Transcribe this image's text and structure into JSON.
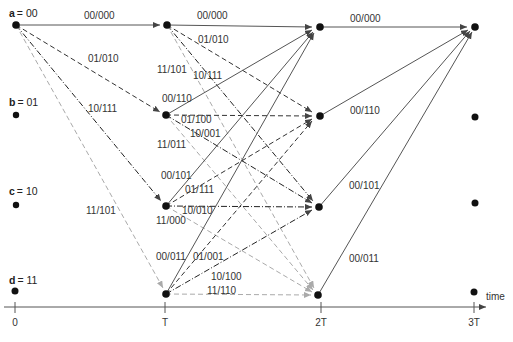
{
  "diagram": {
    "type": "trellis",
    "colors": {
      "solid": "#555555",
      "dashed": "#333333",
      "dashdot": "#222222",
      "lightdashed": "#aaaaaa",
      "node": "#111111",
      "axis": "#555555",
      "text": "#333333"
    },
    "states": [
      {
        "letter": "a",
        "eq": "= 00"
      },
      {
        "letter": "b",
        "eq": "= 01"
      },
      {
        "letter": "c",
        "eq": "= 10"
      },
      {
        "letter": "d",
        "eq": "= 11"
      }
    ],
    "time_ticks": [
      "0",
      "T",
      "2T",
      "3T"
    ],
    "time_label": "time",
    "stage0": {
      "a_a": "00/000",
      "a_b": "01/010",
      "a_c": "10/111",
      "a_d": "11/101"
    },
    "stage1": {
      "a_a": "00/000",
      "a_b": "01/010",
      "a_c": "10/111",
      "a_d": "11/101",
      "b_a": "00/110",
      "b_b": "01/100",
      "b_c": "10/001",
      "b_d": "11/011",
      "c_a": "00/101",
      "c_b": "01/111",
      "c_c": "10/010",
      "c_d": "11/000",
      "d_a": "00/011",
      "d_b": "01/001",
      "d_c": "10/100",
      "d_d": "11/110"
    },
    "stage2": {
      "a_a": "00/000",
      "b_a": "00/110",
      "c_a": "00/101",
      "d_a": "00/011"
    }
  }
}
